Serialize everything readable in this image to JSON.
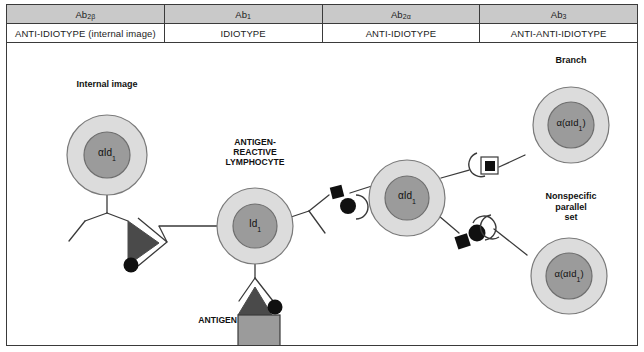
{
  "header": {
    "columns": [
      {
        "code": "Ab",
        "code_sub": "2β",
        "description": "ANTI-IDIOTYPE (internal image)"
      },
      {
        "code": "Ab",
        "code_sub": "1",
        "description": "IDIOTYPE"
      },
      {
        "code": "Ab",
        "code_sub": "2α",
        "description": "ANTI-IDIOTYPE"
      },
      {
        "code": "Ab",
        "code_sub": "3",
        "description": "ANTI-ANTI-IDIOTYPE"
      }
    ]
  },
  "diagram": {
    "labels": {
      "internal_image": "Internal image",
      "antigen_reactive_lymphocyte_line1": "ANTIGEN-",
      "antigen_reactive_lymphocyte_line2": "REACTIVE",
      "antigen_reactive_lymphocyte_line3": "LYMPHOCYTE",
      "antigen": "ANTIGEN",
      "branch": "Branch",
      "nonspecific_line1": "Nonspecific",
      "nonspecific_line2": "parallel",
      "nonspecific_line3": "set"
    },
    "cells": [
      {
        "name": "ab2beta-cell",
        "nucleus_text": "αId",
        "nucleus_sub": "1"
      },
      {
        "name": "ab1-lymphocyte-cell",
        "nucleus_text": "Id",
        "nucleus_sub": "1"
      },
      {
        "name": "ab2alpha-cell",
        "nucleus_text": "αId",
        "nucleus_sub": "1"
      },
      {
        "name": "ab3-branch-cell",
        "nucleus_text": "α(αId",
        "nucleus_sub": "1",
        "nucleus_tail": ")"
      },
      {
        "name": "ab3-parallel-cell",
        "nucleus_text": "α(αId",
        "nucleus_sub": "1",
        "nucleus_tail": ")"
      }
    ],
    "colors": {
      "header_fill": "#c9c9c9",
      "cytoplasm": "#dcdcdc",
      "nucleus": "#9b9b9b",
      "epitope_dark": "#4a4a4a",
      "antigen_body": "#9b9b9b",
      "stroke": "#3a3a3a",
      "marker_black": "#101010",
      "background": "#ffffff"
    }
  }
}
